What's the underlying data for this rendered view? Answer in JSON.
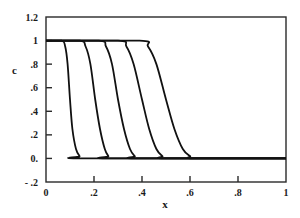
{
  "chart_data": {
    "type": "line",
    "title": "",
    "xlabel": "x",
    "ylabel": "c",
    "xlim": [
      0,
      1
    ],
    "ylim": [
      -0.2,
      1.2
    ],
    "grid": false,
    "legend": null,
    "x_ticks": [
      {
        "value": 0,
        "label": "0"
      },
      {
        "value": 0.2,
        "label": ".2"
      },
      {
        "value": 0.4,
        "label": ".4"
      },
      {
        "value": 0.6,
        "label": ".6"
      },
      {
        "value": 0.8,
        "label": ".8"
      },
      {
        "value": 1,
        "label": "1"
      }
    ],
    "y_ticks": [
      {
        "value": 1.2,
        "label": "1.2"
      },
      {
        "value": 1,
        "label": "1"
      },
      {
        "value": 0.8,
        "label": ".8"
      },
      {
        "value": 0.6,
        "label": ".6"
      },
      {
        "value": 0.4,
        "label": ".4"
      },
      {
        "value": 0.2,
        "label": ".2"
      },
      {
        "value": 0,
        "label": "0."
      },
      {
        "value": -0.2,
        "label": "- .2"
      }
    ],
    "series": [
      {
        "name": "profile 1",
        "x": [
          0,
          0.065,
          0.08,
          0.09,
          0.1,
          0.11,
          0.125,
          0.14,
          0.16,
          1
        ],
        "y": [
          1,
          1,
          0.95,
          0.8,
          0.5,
          0.25,
          0.08,
          0.02,
          0,
          0
        ]
      },
      {
        "name": "profile 2",
        "x": [
          0,
          0.14,
          0.165,
          0.185,
          0.205,
          0.225,
          0.245,
          0.26,
          0.275,
          1
        ],
        "y": [
          1,
          1,
          0.95,
          0.8,
          0.5,
          0.25,
          0.08,
          0.02,
          0,
          0
        ]
      },
      {
        "name": "profile 3",
        "x": [
          0,
          0.22,
          0.25,
          0.275,
          0.3,
          0.325,
          0.35,
          0.37,
          0.39,
          1
        ],
        "y": [
          1,
          1,
          0.95,
          0.8,
          0.5,
          0.25,
          0.08,
          0.02,
          0,
          0
        ]
      },
      {
        "name": "profile 4",
        "x": [
          0,
          0.3,
          0.335,
          0.365,
          0.4,
          0.43,
          0.46,
          0.485,
          0.51,
          1
        ],
        "y": [
          1,
          1,
          0.95,
          0.8,
          0.5,
          0.25,
          0.08,
          0.02,
          0,
          0
        ]
      },
      {
        "name": "profile 5",
        "x": [
          0,
          0.39,
          0.425,
          0.46,
          0.5,
          0.535,
          0.57,
          0.6,
          0.625,
          1
        ],
        "y": [
          1,
          1,
          0.95,
          0.8,
          0.5,
          0.25,
          0.08,
          0.02,
          0,
          0
        ]
      }
    ]
  },
  "axes": {
    "xlabel": "x",
    "ylabel": "c"
  }
}
